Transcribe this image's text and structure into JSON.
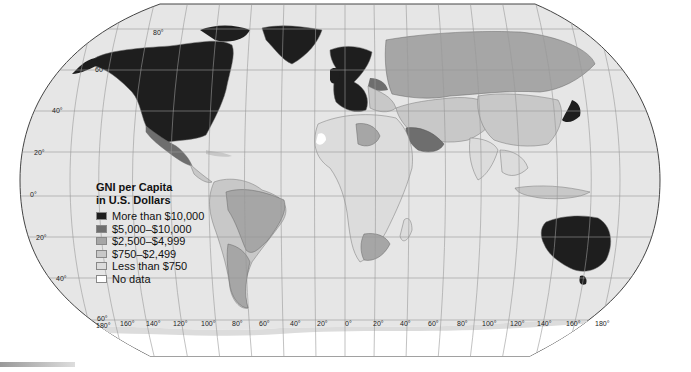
{
  "map": {
    "title": "GNI per Capita in U.S. Dollars",
    "projection": "Robinson",
    "ocean_color": "#e6e6e6",
    "border_color": "#777777"
  },
  "legend": {
    "title_line1": "GNI per Capita",
    "title_line2": "in U.S. Dollars",
    "items": [
      {
        "label": "More than $10,000",
        "color": "#1e1e1e"
      },
      {
        "label": "$5,000–$10,000",
        "color": "#6e6e6e"
      },
      {
        "label": "$2,500–$4,999",
        "color": "#a6a6a6"
      },
      {
        "label": "$750–$2,499",
        "color": "#c8c8c8"
      },
      {
        "label": "Less than $750",
        "color": "#dcdcdc"
      },
      {
        "label": "No data",
        "color": "#ffffff"
      }
    ]
  },
  "latitude_labels": [
    "80°",
    "60°",
    "40°",
    "20°",
    "0°",
    "20°",
    "40°",
    "60°"
  ],
  "longitude_labels": [
    "180°",
    "160°",
    "140°",
    "120°",
    "100°",
    "80°",
    "60°",
    "40°",
    "20°",
    "0°",
    "20°",
    "40°",
    "60°",
    "80°",
    "100°",
    "120°",
    "140°",
    "160°",
    "180°"
  ],
  "regions": [
    {
      "name": "North America (US/Canada)",
      "class": "More than $10,000"
    },
    {
      "name": "Greenland",
      "class": "More than $10,000"
    },
    {
      "name": "Western Europe",
      "class": "More than $10,000"
    },
    {
      "name": "Japan",
      "class": "More than $10,000"
    },
    {
      "name": "Australia",
      "class": "More than $10,000"
    },
    {
      "name": "New Zealand",
      "class": "More than $10,000"
    },
    {
      "name": "Mexico",
      "class": "$5,000–$10,000"
    },
    {
      "name": "Saudi Arabia",
      "class": "$5,000–$10,000"
    },
    {
      "name": "Poland",
      "class": "$5,000–$10,000"
    },
    {
      "name": "Russia",
      "class": "$2,500–$4,999"
    },
    {
      "name": "Brazil",
      "class": "$2,500–$4,999"
    },
    {
      "name": "Argentina",
      "class": "$2,500–$4,999"
    },
    {
      "name": "Libya",
      "class": "$2,500–$4,999"
    },
    {
      "name": "South Africa",
      "class": "$2,500–$4,999"
    },
    {
      "name": "China",
      "class": "$750–$2,499"
    },
    {
      "name": "Africa (most)",
      "class": "Less than $750"
    },
    {
      "name": "Western Sahara",
      "class": "No data"
    }
  ]
}
